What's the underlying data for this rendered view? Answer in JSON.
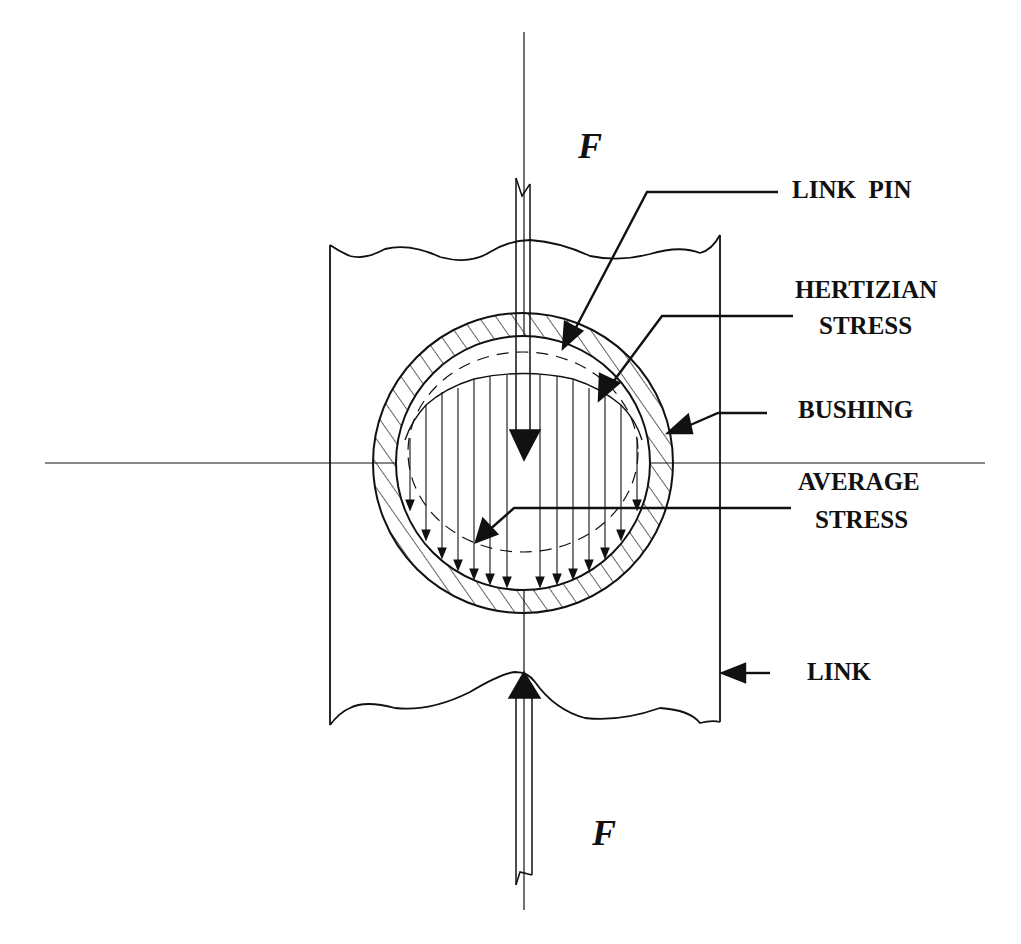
{
  "diagram": {
    "colors": {
      "ink": "#111111",
      "background": "#ffffff"
    },
    "forces": {
      "top": {
        "label": "F",
        "direction": "down"
      },
      "bottom": {
        "label": "F",
        "direction": "up"
      }
    },
    "labels": {
      "link_pin": "LINK  PIN",
      "hertizian_line1": "HERTIZIAN",
      "hertizian_line2": "STRESS",
      "bushing": "BUSHING",
      "average_line1": "AVERAGE",
      "average_line2": "STRESS",
      "link": "LINK"
    },
    "components": [
      "link",
      "bushing",
      "link-pin",
      "hertizian-stress-distribution",
      "average-stress-distribution"
    ]
  }
}
